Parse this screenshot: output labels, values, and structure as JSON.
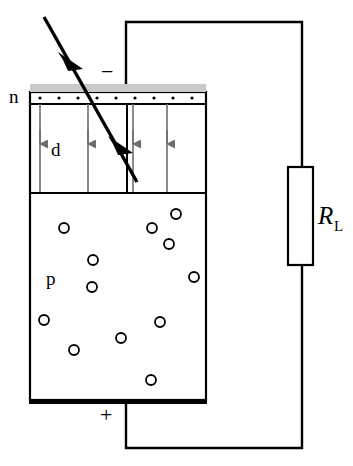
{
  "figure": {
    "type": "schematic"
  },
  "labels": {
    "n_layer": "n",
    "depletion_width": "d",
    "p_layer": "p",
    "negative_terminal": "−",
    "positive_terminal": "+",
    "resistor_main": "R",
    "resistor_sub": "L"
  },
  "colors": {
    "outline": "#000000",
    "metal_contact": "#c9c9c9",
    "field_arrow": "#6e6e6e",
    "background": "#ffffff",
    "electrode": "#000000"
  },
  "geometry": {
    "device": {
      "x": 30,
      "y": 84,
      "width": 176,
      "height": 320
    },
    "metal_contact_strip": {
      "x": 30,
      "y": 84,
      "width": 176,
      "height": 8
    },
    "n_layer": {
      "x": 30,
      "y": 92,
      "width": 176,
      "height": 12
    },
    "depletion_region": {
      "x": 30,
      "y": 104,
      "width": 176,
      "height": 89
    },
    "p_region": {
      "x": 30,
      "y": 193,
      "width": 176,
      "height": 207
    },
    "bottom_electrode": {
      "x": 30,
      "y": 400,
      "width": 176,
      "height": 5
    },
    "resistor_box": {
      "x": 288,
      "y": 167,
      "width": 25,
      "height": 98
    },
    "circuit_wire": {
      "top_y": 22,
      "bottom_y": 448,
      "left_x": 126,
      "right_x": 302
    }
  },
  "n_layer_dots": [
    {
      "cx": 40,
      "cy": 98
    },
    {
      "cx": 59,
      "cy": 98
    },
    {
      "cx": 78,
      "cy": 98
    },
    {
      "cx": 97,
      "cy": 98
    },
    {
      "cx": 116,
      "cy": 98
    },
    {
      "cx": 135,
      "cy": 98
    },
    {
      "cx": 154,
      "cy": 98
    },
    {
      "cx": 173,
      "cy": 98
    },
    {
      "cx": 192,
      "cy": 98
    }
  ],
  "field_lines": [
    {
      "x": 40,
      "y1": 104,
      "y2": 193,
      "arrow_y": 143
    },
    {
      "x": 88,
      "y1": 104,
      "y2": 193,
      "arrow_y": 143
    },
    {
      "x": 133,
      "y1": 104,
      "y2": 193,
      "arrow_y": 143
    },
    {
      "x": 167,
      "y1": 104,
      "y2": 193,
      "arrow_y": 143
    }
  ],
  "junction_divider": {
    "x": 127,
    "y1": 104,
    "y2": 193
  },
  "p_region_carriers": [
    {
      "cx": 64,
      "cy": 228,
      "r": 5
    },
    {
      "cx": 152,
      "cy": 228,
      "r": 5
    },
    {
      "cx": 169,
      "cy": 244,
      "r": 5
    },
    {
      "cx": 176,
      "cy": 214,
      "r": 5
    },
    {
      "cx": 93,
      "cy": 260,
      "r": 5
    },
    {
      "cx": 92,
      "cy": 287,
      "r": 5
    },
    {
      "cx": 194,
      "cy": 277,
      "r": 5
    },
    {
      "cx": 44,
      "cy": 320,
      "r": 5
    },
    {
      "cx": 160,
      "cy": 322,
      "r": 5
    },
    {
      "cx": 121,
      "cy": 338,
      "r": 5
    },
    {
      "cx": 74,
      "cy": 350,
      "r": 5
    },
    {
      "cx": 151,
      "cy": 380,
      "r": 5
    }
  ],
  "light_ray": {
    "x1": 44,
    "y1": 17,
    "x2": 137,
    "y2": 182,
    "arrowheads": [
      {
        "x": 72,
        "y": 66
      },
      {
        "x": 122,
        "y": 150
      }
    ]
  }
}
